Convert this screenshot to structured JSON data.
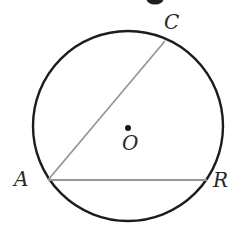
{
  "figure": {
    "labels": {
      "left_point": "A",
      "top_point": "C",
      "right_point": "R",
      "center": "O"
    },
    "colors": {
      "background": "#ffffff",
      "circle_stroke": "#1c1c1c",
      "chord": "#979797",
      "center_dot": "#161616",
      "label_text": "#272727",
      "cropped_fragment": "#1e1e1e"
    }
  }
}
